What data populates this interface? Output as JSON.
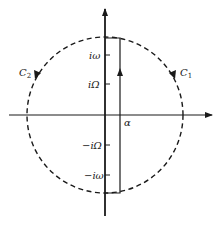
{
  "diagram": {
    "type": "complex-plane contour diagram",
    "axes": {
      "real_axis": {
        "direction": "right",
        "arrow": true
      },
      "imag_axis": {
        "direction": "up",
        "arrow": true
      }
    },
    "circle": {
      "style": "dashed",
      "center": "origin"
    },
    "contours": [
      {
        "id": "C1",
        "label": "C",
        "subscript": "1",
        "side": "right",
        "direction": "clockwise"
      },
      {
        "id": "C2",
        "label": "C",
        "subscript": "2",
        "side": "left",
        "direction": "counterclockwise"
      }
    ],
    "bromwich_line": {
      "x_label": "α",
      "direction": "up"
    },
    "ticks": {
      "pos_omega": "iω",
      "pos_Omega": "iΩ",
      "neg_Omega": "−iΩ",
      "neg_omega": "−iω"
    },
    "colors": {
      "ink": "#1a1a1a",
      "background": "#ffffff"
    }
  }
}
